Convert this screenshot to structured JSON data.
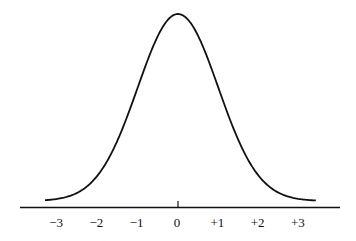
{
  "chart_data": {
    "type": "line",
    "title": "",
    "xlabel": "",
    "ylabel": "",
    "x_ticks": [
      "−3",
      "−2",
      "−1",
      "0",
      "+1",
      "+2",
      "+3"
    ],
    "x_tick_values": [
      -3,
      -2,
      -1,
      0,
      1,
      2,
      3
    ],
    "xlim": [
      -3.3,
      3.4
    ],
    "series": [
      {
        "name": "normal density",
        "x": [
          -3.3,
          -3,
          -2.5,
          -2,
          -1.5,
          -1,
          -0.5,
          0,
          0.5,
          1,
          1.5,
          2,
          2.5,
          3,
          3.35
        ],
        "y": [
          0.0017,
          0.0044,
          0.0175,
          0.054,
          0.1295,
          0.242,
          0.3521,
          0.3989,
          0.3521,
          0.242,
          0.1295,
          0.054,
          0.0175,
          0.0044,
          0.0015
        ]
      }
    ],
    "grid": false,
    "legend": null,
    "center_tick": "0"
  }
}
